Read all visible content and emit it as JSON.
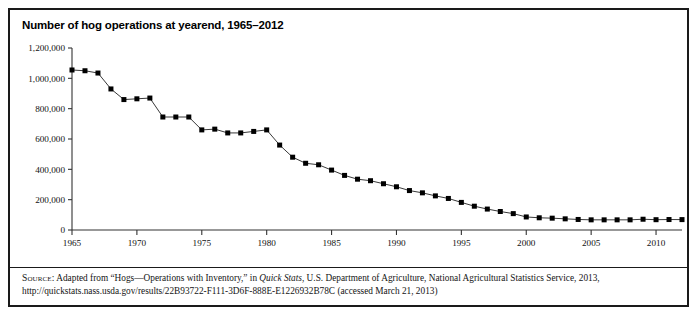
{
  "figure": {
    "title": "Number of hog operations at yearend, 1965–2012",
    "border_color": "#1a1a1a",
    "background": "#ffffff"
  },
  "source": {
    "label": "Source:",
    "text_before_italic": " Adapted from “Hogs—Operations with Inventory,” in ",
    "italic_title": "Quick Stats",
    "text_after_italic": ", U.S. Department of Agriculture, National Agricultural Statistics Service, 2013, http://quickstats.nass.usda.gov/results/22B93722-F111-3D6F-888E-E1226932B78C (accessed March 21, 2013)"
  },
  "chart_data": {
    "type": "line",
    "title": "Number of hog operations at yearend, 1965–2012",
    "xlabel": "",
    "ylabel": "",
    "xlim": [
      1965,
      2012
    ],
    "ylim": [
      0,
      1200000
    ],
    "grid": false,
    "legend": "none",
    "marker": "square",
    "marker_color": "#000000",
    "line_color": "#222222",
    "ytick_labels": [
      "0",
      "200,000",
      "400,000",
      "600,000",
      "800,000",
      "1,000,000",
      "1,200,000"
    ],
    "ytick_values": [
      0,
      200000,
      400000,
      600000,
      800000,
      1000000,
      1200000
    ],
    "xtick_labels": [
      "1965",
      "1970",
      "1975",
      "1980",
      "1985",
      "1990",
      "1995",
      "2000",
      "2005",
      "2010"
    ],
    "xtick_values": [
      1965,
      1970,
      1975,
      1980,
      1985,
      1990,
      1995,
      2000,
      2005,
      2010
    ],
    "x": [
      1965,
      1966,
      1967,
      1968,
      1969,
      1970,
      1971,
      1972,
      1973,
      1974,
      1975,
      1976,
      1977,
      1978,
      1979,
      1980,
      1981,
      1982,
      1983,
      1984,
      1985,
      1986,
      1987,
      1988,
      1989,
      1990,
      1991,
      1992,
      1993,
      1994,
      1995,
      1996,
      1997,
      1998,
      1999,
      2000,
      2001,
      2002,
      2003,
      2004,
      2005,
      2006,
      2007,
      2008,
      2009,
      2010,
      2011,
      2012
    ],
    "values": [
      1055000,
      1050000,
      1035000,
      930000,
      860000,
      865000,
      870000,
      745000,
      745000,
      745000,
      660000,
      665000,
      640000,
      640000,
      650000,
      660000,
      560000,
      480000,
      440000,
      430000,
      395000,
      360000,
      335000,
      325000,
      305000,
      285000,
      260000,
      245000,
      225000,
      208000,
      182000,
      157000,
      138000,
      122000,
      108000,
      86000,
      80500,
      78000,
      73600,
      69500,
      67000,
      67000,
      67000,
      67000,
      71000,
      68000,
      69000,
      68600
    ],
    "series": [
      {
        "name": "Hog operations",
        "values": [
          1055000,
          1050000,
          1035000,
          930000,
          860000,
          865000,
          870000,
          745000,
          745000,
          745000,
          660000,
          665000,
          640000,
          640000,
          650000,
          660000,
          560000,
          480000,
          440000,
          430000,
          395000,
          360000,
          335000,
          325000,
          305000,
          285000,
          260000,
          245000,
          225000,
          208000,
          182000,
          157000,
          138000,
          122000,
          108000,
          86000,
          80500,
          78000,
          73600,
          69500,
          67000,
          67000,
          67000,
          67000,
          71000,
          68000,
          69000,
          68600
        ]
      }
    ]
  }
}
